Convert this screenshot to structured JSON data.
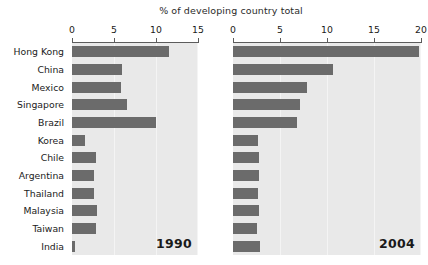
{
  "title": "% of developing country total",
  "categories": [
    "Hong Kong",
    "China",
    "Mexico",
    "Singapore",
    "Brazil",
    "Korea",
    "Chile",
    "Argentina",
    "Thailand",
    "Malaysia",
    "Taiwan",
    "India"
  ],
  "colors": {
    "bar": "#6b6b6b",
    "panel_background": "#e9e9e9",
    "gridline": "#f4f4f4",
    "axis": "#5c5c5c",
    "text": "#1b1b1b"
  },
  "panels": [
    {
      "year_label": "1990",
      "axis_ticks": [
        0,
        5,
        10,
        15
      ],
      "xlim": [
        0,
        15
      ],
      "values": [
        11.6,
        5.9,
        5.8,
        6.5,
        10.0,
        1.6,
        2.9,
        2.6,
        2.6,
        3.0,
        2.9,
        0.4
      ]
    },
    {
      "year_label": "2004",
      "axis_ticks": [
        0,
        5,
        10,
        15,
        20
      ],
      "xlim": [
        0,
        20
      ],
      "values": [
        19.8,
        10.6,
        7.9,
        7.1,
        6.8,
        2.7,
        2.8,
        2.8,
        2.7,
        2.8,
        2.5,
        2.9
      ]
    }
  ],
  "chart_data": {
    "type": "bar",
    "title": "% of developing country total",
    "xlabel": "% of developing country total",
    "ylabel": "",
    "orientation": "horizontal",
    "grid": true,
    "legend": "none",
    "categories": [
      "Hong Kong",
      "China",
      "Mexico",
      "Singapore",
      "Brazil",
      "Korea",
      "Chile",
      "Argentina",
      "Thailand",
      "Malaysia",
      "Taiwan",
      "India"
    ],
    "panels": [
      {
        "name": "1990",
        "xlim": [
          0,
          15
        ],
        "xticks": [
          0,
          5,
          10,
          15
        ],
        "values": [
          11.6,
          5.9,
          5.8,
          6.5,
          10.0,
          1.6,
          2.9,
          2.6,
          2.6,
          3.0,
          2.9,
          0.4
        ]
      },
      {
        "name": "2004",
        "xlim": [
          0,
          20
        ],
        "xticks": [
          0,
          5,
          10,
          15,
          20
        ],
        "values": [
          19.8,
          10.6,
          7.9,
          7.1,
          6.8,
          2.7,
          2.8,
          2.8,
          2.7,
          2.8,
          2.5,
          2.9
        ]
      }
    ],
    "series": [
      {
        "name": "1990",
        "values": [
          11.6,
          5.9,
          5.8,
          6.5,
          10.0,
          1.6,
          2.9,
          2.6,
          2.6,
          3.0,
          2.9,
          0.4
        ]
      },
      {
        "name": "2004",
        "values": [
          19.8,
          10.6,
          7.9,
          7.1,
          6.8,
          2.7,
          2.8,
          2.8,
          2.7,
          2.8,
          2.5,
          2.9
        ]
      }
    ]
  }
}
